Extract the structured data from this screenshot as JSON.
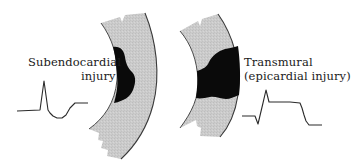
{
  "figure": {
    "left_panel": {
      "label_line1": "Subendocardial",
      "label_line2": "injury",
      "ecg_description": "ST-segment depression"
    },
    "right_panel": {
      "label_line1": "Transmural",
      "label_line2": "(epicardial injury)",
      "ecg_description": "ST-segment elevation"
    },
    "colors": {
      "tissue_fill": "#c8c8c8",
      "injury_fill": "#0a0a0a",
      "outline": "#3a3a3a",
      "ecg_line": "#2a2a2a",
      "text": "#1a1a1a",
      "background": "#ffffff"
    }
  }
}
